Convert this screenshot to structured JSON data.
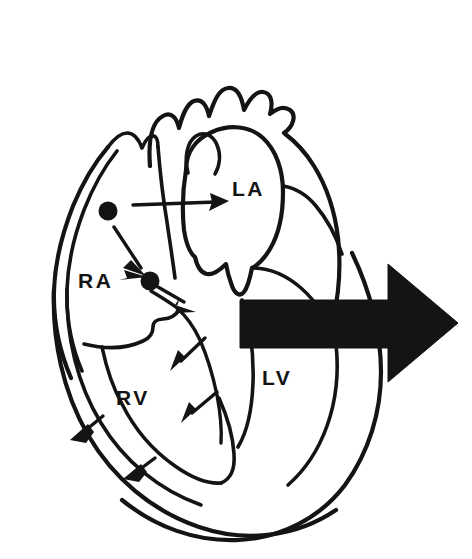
{
  "figure": {
    "background_color": "#ffffff",
    "ink_color": "#141414",
    "width": 472,
    "height": 559
  },
  "labels": {
    "right_atrium": "RA",
    "right_ventricle": "RV",
    "left_atrium": "LA",
    "left_ventricle": "LV"
  },
  "label_positions": {
    "right_atrium": {
      "x": 78,
      "y": 288
    },
    "right_ventricle": {
      "x": 116,
      "y": 405
    },
    "left_atrium": {
      "x": 232,
      "y": 196
    },
    "left_ventricle": {
      "x": 262,
      "y": 385
    }
  },
  "nodes": [
    {
      "name": "sa-node",
      "x": 108,
      "y": 211,
      "r": 9
    },
    {
      "name": "av-node",
      "x": 150,
      "y": 281,
      "r": 9
    }
  ],
  "arrows": {
    "internodal_to_av": {
      "from_x": 113,
      "from_y": 228,
      "to_x": 144,
      "to_y": 272
    },
    "interatrial_to_la": {
      "from_x": 133,
      "from_y": 206,
      "to_x": 226,
      "to_y": 201
    },
    "bundle_right": {
      "from_x": 163,
      "from_y": 290,
      "to_x": 192,
      "to_y": 308
    },
    "bundle_mid": {
      "from_x": 201,
      "from_y": 343,
      "to_x": 175,
      "to_y": 368
    },
    "bundle_low": {
      "from_x": 215,
      "from_y": 397,
      "to_x": 186,
      "to_y": 419
    },
    "purkinje_upper": {
      "from_x": 100,
      "from_y": 423,
      "to_x": 71,
      "to_y": 437
    },
    "purkinje_lower": {
      "from_x": 153,
      "from_y": 465,
      "to_x": 124,
      "to_y": 477
    }
  },
  "ejection_arrow": {
    "name": "blood-ejection-arrow",
    "direction": "right",
    "color": "#141414",
    "tail_x": 240,
    "tail_y": 300,
    "tip_x": 458,
    "tip_y": 323,
    "shaft_height": 50,
    "head_height": 118
  }
}
